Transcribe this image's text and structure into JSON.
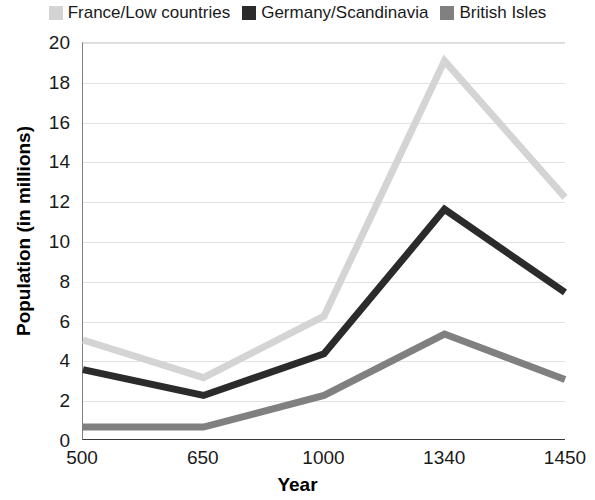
{
  "chart_data": {
    "type": "line",
    "title": "",
    "xlabel": "Year",
    "ylabel": "Population (in millions)",
    "categories": [
      "500",
      "650",
      "1000",
      "1340",
      "1450"
    ],
    "x": [
      500,
      650,
      1000,
      1340,
      1450
    ],
    "ylim": [
      0,
      20
    ],
    "yticks": [
      0,
      2,
      4,
      6,
      8,
      10,
      12,
      14,
      16,
      18,
      20
    ],
    "grid": true,
    "legend_position": "top",
    "series": [
      {
        "name": "France/Low countries",
        "color": "#d4d4d4",
        "values": [
          5.0,
          3.1,
          6.2,
          19.1,
          12.2
        ]
      },
      {
        "name": "Germany/Scandinavia",
        "color": "#2b2b2b",
        "values": [
          3.5,
          2.2,
          4.3,
          11.6,
          7.4
        ]
      },
      {
        "name": "British Isles",
        "color": "#808080",
        "values": [
          0.6,
          0.6,
          2.2,
          5.3,
          3.0
        ]
      }
    ]
  },
  "legend": {
    "items": [
      {
        "label": "France/Low countries",
        "swatch_color": "#d4d4d4",
        "icon": "legend-swatch-icon"
      },
      {
        "label": "Germany/Scandinavia",
        "swatch_color": "#2b2b2b",
        "icon": "legend-swatch-icon"
      },
      {
        "label": "British Isles",
        "swatch_color": "#808080",
        "icon": "legend-swatch-icon"
      }
    ]
  },
  "axes": {
    "y_title": "Population (in millions)",
    "x_title": "Year",
    "y_ticks": [
      "0",
      "2",
      "4",
      "6",
      "8",
      "10",
      "12",
      "14",
      "16",
      "18",
      "20"
    ],
    "x_ticks": [
      "500",
      "650",
      "1000",
      "1340",
      "1450"
    ]
  },
  "style": {
    "background": "#ffffff",
    "gridline_color": "#e2e2e2",
    "axis_color": "#3a3a3a",
    "text_color": "#1a1a1a"
  }
}
